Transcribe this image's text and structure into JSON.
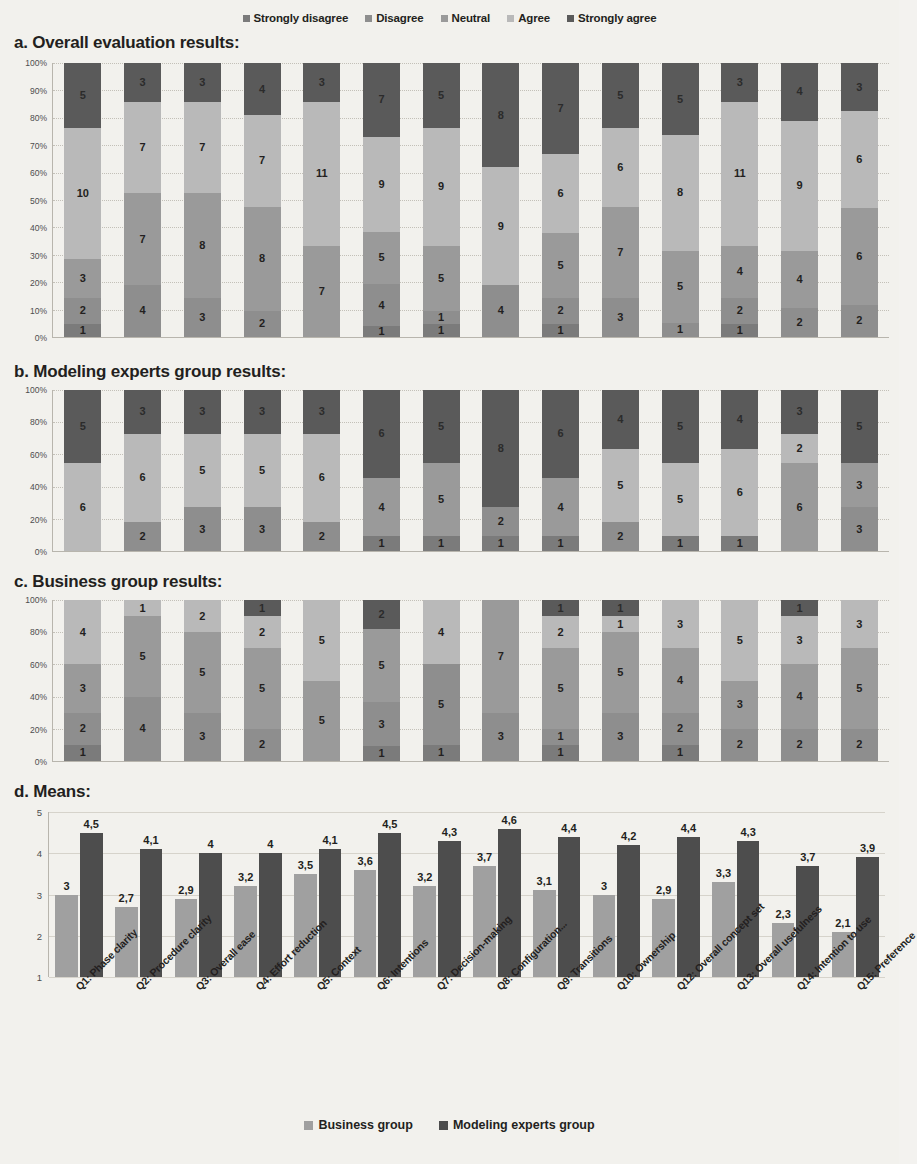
{
  "legend_top": {
    "items": [
      {
        "label": "Strongly disagree",
        "color": "#7b7b7b"
      },
      {
        "label": "Disagree",
        "color": "#8e8e8e"
      },
      {
        "label": "Neutral",
        "color": "#9a9a9a"
      },
      {
        "label": "Agree",
        "color": "#b9b9b9"
      },
      {
        "label": "Strongly agree",
        "color": "#5a5a5a"
      }
    ]
  },
  "legend_bottom": {
    "items": [
      {
        "label": "Business group",
        "color": "#a0a0a0"
      },
      {
        "label": "Modeling experts group",
        "color": "#4d4d4d"
      }
    ]
  },
  "sections": {
    "a": "a. Overall  evaluation results:",
    "b": "b. Modeling experts group results:",
    "c": "c. Business group results:",
    "d": "d. Means:"
  },
  "y_ticks_percent": [
    "100%",
    "90%",
    "80%",
    "70%",
    "60%",
    "50%",
    "40%",
    "30%",
    "20%",
    "10%",
    "0%"
  ],
  "y_ticks_percent_bc": [
    "100%",
    "80%",
    "60%",
    "40%",
    "20%",
    "0%"
  ],
  "y_ticks_means": [
    "5",
    "4",
    "3",
    "2",
    "1"
  ],
  "questions": [
    "Q1: Phase clarity",
    "Q2: Procedure clarity",
    "Q3: Overall ease",
    "Q4: Effort reduction",
    "Q5: Context",
    "Q6: Intentions",
    "Q7: Decision-making",
    "Q8: Configuration...",
    "Q9: Transitions",
    "Q10: Ownership",
    "Q12: Overall concept set",
    "Q13: Overall usefulness",
    "Q14: Intention to use",
    "Q15: Preference"
  ],
  "chart_data": [
    {
      "type": "bar",
      "title": "a. Overall  evaluation results:",
      "subtype": "stacked-100",
      "ylabel": "",
      "xlabel": "",
      "ylim": [
        0,
        100
      ],
      "grid": true,
      "legend_position": "top",
      "categories": [
        "Q1: Phase clarity",
        "Q2: Procedure clarity",
        "Q3: Overall ease",
        "Q4: Effort reduction",
        "Q5: Context",
        "Q6: Intentions",
        "Q7: Decision-making",
        "Q8: Configuration...",
        "Q9: Transitions",
        "Q10: Ownership",
        "Q12: Overall concept set",
        "Q13: Overall usefulness",
        "Q14: Intention to use",
        "Q15: Preference"
      ],
      "series": [
        {
          "name": "Strongly disagree",
          "values": [
            1,
            0,
            0,
            0,
            0,
            1,
            1,
            0,
            1,
            0,
            0,
            1,
            0,
            0
          ]
        },
        {
          "name": "Disagree",
          "values": [
            2,
            4,
            3,
            2,
            0,
            4,
            1,
            4,
            2,
            3,
            1,
            2,
            2,
            2
          ]
        },
        {
          "name": "Neutral",
          "values": [
            3,
            7,
            8,
            8,
            7,
            5,
            5,
            0,
            5,
            7,
            5,
            4,
            4,
            6
          ]
        },
        {
          "name": "Agree",
          "values": [
            10,
            7,
            7,
            7,
            11,
            9,
            9,
            9,
            6,
            6,
            8,
            11,
            9,
            6
          ]
        },
        {
          "name": "Strongly agree",
          "values": [
            5,
            3,
            3,
            4,
            3,
            7,
            5,
            8,
            7,
            5,
            5,
            3,
            4,
            3
          ]
        }
      ]
    },
    {
      "type": "bar",
      "title": "b. Modeling experts group results:",
      "subtype": "stacked-100",
      "ylim": [
        0,
        100
      ],
      "grid": true,
      "categories": [
        "Q1: Phase clarity",
        "Q2: Procedure clarity",
        "Q3: Overall ease",
        "Q4: Effort reduction",
        "Q5: Context",
        "Q6: Intentions",
        "Q7: Decision-making",
        "Q8: Configuration...",
        "Q9: Transitions",
        "Q10: Ownership",
        "Q12: Overall concept set",
        "Q13: Overall usefulness",
        "Q14: Intention to use",
        "Q15: Preference"
      ],
      "series": [
        {
          "name": "Strongly disagree",
          "values": [
            0,
            0,
            0,
            0,
            0,
            1,
            1,
            1,
            1,
            0,
            1,
            1,
            0,
            0
          ]
        },
        {
          "name": "Disagree",
          "values": [
            0,
            2,
            3,
            3,
            2,
            0,
            0,
            2,
            0,
            2,
            0,
            0,
            0,
            3
          ]
        },
        {
          "name": "Neutral",
          "values": [
            0,
            0,
            0,
            0,
            0,
            4,
            5,
            0,
            4,
            0,
            0,
            0,
            6,
            3
          ]
        },
        {
          "name": "Agree",
          "values": [
            6,
            6,
            5,
            5,
            6,
            0,
            0,
            0,
            0,
            5,
            5,
            6,
            2,
            0
          ]
        },
        {
          "name": "Strongly agree",
          "values": [
            5,
            3,
            3,
            3,
            3,
            6,
            5,
            8,
            6,
            4,
            5,
            4,
            3,
            5
          ]
        }
      ]
    },
    {
      "type": "bar",
      "title": "c. Business group results:",
      "subtype": "stacked-100",
      "ylim": [
        0,
        100
      ],
      "grid": true,
      "categories": [
        "Q1: Phase clarity",
        "Q2: Procedure clarity",
        "Q3: Overall ease",
        "Q4: Effort reduction",
        "Q5: Context",
        "Q6: Intentions",
        "Q7: Decision-making",
        "Q8: Configuration...",
        "Q9: Transitions",
        "Q10: Ownership",
        "Q12: Overall concept set",
        "Q13: Overall usefulness",
        "Q14: Intention to use",
        "Q15: Preference"
      ],
      "series": [
        {
          "name": "Strongly disagree",
          "values": [
            1,
            0,
            0,
            0,
            0,
            1,
            1,
            0,
            1,
            0,
            1,
            0,
            0,
            0
          ]
        },
        {
          "name": "Disagree",
          "values": [
            2,
            4,
            3,
            2,
            0,
            3,
            5,
            3,
            1,
            3,
            2,
            2,
            2,
            2
          ]
        },
        {
          "name": "Neutral",
          "values": [
            3,
            5,
            5,
            5,
            5,
            5,
            0,
            7,
            5,
            5,
            4,
            3,
            4,
            5
          ]
        },
        {
          "name": "Agree",
          "values": [
            4,
            1,
            2,
            2,
            5,
            0,
            4,
            0,
            2,
            1,
            3,
            5,
            3,
            3
          ]
        },
        {
          "name": "Strongly agree",
          "values": [
            0,
            0,
            0,
            1,
            0,
            2,
            0,
            0,
            1,
            1,
            0,
            0,
            1,
            0
          ]
        }
      ]
    },
    {
      "type": "bar",
      "title": "d. Means:",
      "subtype": "grouped",
      "ylabel": "",
      "ylim": [
        1,
        5
      ],
      "grid": true,
      "legend_position": "bottom",
      "categories": [
        "Q1: Phase clarity",
        "Q2: Procedure clarity",
        "Q3: Overall ease",
        "Q4: Effort reduction",
        "Q5: Context",
        "Q6: Intentions",
        "Q7: Decision-making",
        "Q8: Configuration...",
        "Q9: Transitions",
        "Q10: Ownership",
        "Q12: Overall concept set",
        "Q13: Overall usefulness",
        "Q14: Intention to use",
        "Q15: Preference"
      ],
      "series": [
        {
          "name": "Business group",
          "values": [
            3,
            2.7,
            2.9,
            3.2,
            3.5,
            3.6,
            3.2,
            3.7,
            3.1,
            3,
            2.9,
            3.3,
            2.3,
            2.1
          ],
          "labels": [
            "3",
            "2,7",
            "2,9",
            "3,2",
            "3,5",
            "3,6",
            "3,2",
            "3,7",
            "3,1",
            "3",
            "2,9",
            "3,3",
            "2,3",
            "2,1"
          ]
        },
        {
          "name": "Modeling experts group",
          "values": [
            4.5,
            4.1,
            4,
            4,
            4.1,
            4.5,
            4.3,
            4.6,
            4.4,
            4.2,
            4.4,
            4.3,
            3.7,
            3.9
          ],
          "labels": [
            "4,5",
            "4,1",
            "4",
            "4",
            "4,1",
            "4,5",
            "4,3",
            "4,6",
            "4,4",
            "4,2",
            "4,4",
            "4,3",
            "3,7",
            "3,9"
          ]
        }
      ]
    }
  ],
  "colors": {
    "strongly_disagree": "#7b7b7b",
    "disagree": "#8e8e8e",
    "neutral": "#9a9a9a",
    "agree": "#b9b9b9",
    "strongly_agree": "#5a5a5a",
    "business": "#a0a0a0",
    "experts": "#4d4d4d",
    "background": "#f2f1ed"
  }
}
